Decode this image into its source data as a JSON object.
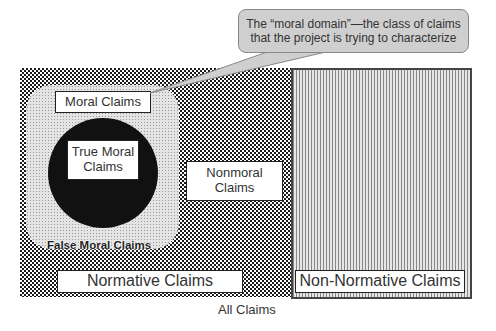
{
  "diagram": {
    "outer_caption": "All Claims",
    "regions": {
      "normative": "Normative Claims",
      "non_normative": "Non-Normative Claims",
      "moral": "Moral Claims",
      "true_moral_line1": "True Moral",
      "true_moral_line2": "Claims",
      "false_moral": "False Moral Claims",
      "nonmoral_line1": "Nonmoral",
      "nonmoral_line2": "Claims"
    },
    "callout": {
      "line1": "The “moral domain”—the class of claims",
      "line2": "that the project is trying to characterize"
    },
    "colors": {
      "checker": "#1a1a1a",
      "stripes": "#888888",
      "moral_fill": "#e4e4e4",
      "true_moral_fill": "#111111",
      "callout_fill": "#cfcfcf"
    }
  }
}
